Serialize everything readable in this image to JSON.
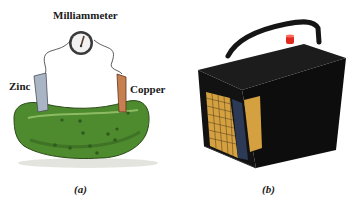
{
  "figure": {
    "panel_a": {
      "labels": {
        "meter": "Milliammeter",
        "left_electrode": "Zinc",
        "right_electrode": "Copper"
      },
      "caption": "(a)",
      "colors": {
        "pickle": "#4e8a2e",
        "zinc": "#a9b4c4",
        "copper": "#c77f4f"
      }
    },
    "panel_b": {
      "caption": "(b)",
      "colors": {
        "battery_body": "#111111",
        "terminal": "#e0281e",
        "plates": "#d4a040"
      }
    }
  }
}
